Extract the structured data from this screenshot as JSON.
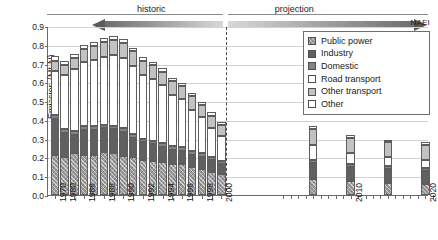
{
  "chart_data": {
    "type": "bar",
    "stacked": true,
    "title": "",
    "xlabel": "",
    "ylabel": "Emission (Mt-N)",
    "ylim": [
      0.0,
      0.9
    ],
    "ytick_labels": [
      "0.0",
      "0.1",
      "0.2",
      "0.3",
      "0.4",
      "0.5",
      "0.6",
      "0.7",
      "0.8",
      "0.9"
    ],
    "ytick_values": [
      0.0,
      0.1,
      0.2,
      0.3,
      0.4,
      0.5,
      0.6,
      0.7,
      0.8,
      0.9
    ],
    "grid": true,
    "legend_position": "top-right",
    "source_label": "NAEI",
    "annotations": [
      {
        "text": "historic",
        "arrow": "left"
      },
      {
        "text": "projection",
        "arrow": "right"
      }
    ],
    "divider_after": 2000,
    "x": [
      1970,
      1980,
      1985,
      1986,
      1987,
      1988,
      1989,
      1990,
      1991,
      1992,
      1993,
      1994,
      1995,
      1996,
      1997,
      1998,
      1999,
      2000,
      2005,
      2010,
      2015,
      2020
    ],
    "xtick_labels": [
      "1970",
      "1980",
      "1986",
      "1988",
      "1990",
      "1992",
      "1994",
      "1996",
      "1998",
      "2000",
      "2010",
      "2020"
    ],
    "series": [
      {
        "name": "Public power",
        "color": "#9a9a9a",
        "values": [
          0.215,
          0.205,
          0.225,
          0.215,
          0.215,
          0.23,
          0.225,
          0.21,
          0.2,
          0.185,
          0.18,
          0.175,
          0.165,
          0.165,
          0.15,
          0.14,
          0.125,
          0.11,
          0.085,
          0.075,
          0.065,
          0.06
        ]
      },
      {
        "name": "Industry",
        "color": "#606060",
        "values": [
          0.19,
          0.125,
          0.095,
          0.13,
          0.13,
          0.125,
          0.125,
          0.125,
          0.105,
          0.095,
          0.09,
          0.08,
          0.075,
          0.07,
          0.065,
          0.065,
          0.06,
          0.055,
          0.085,
          0.075,
          0.075,
          0.07
        ]
      },
      {
        "name": "Domestic",
        "color": "#848484",
        "values": [
          0.02,
          0.02,
          0.02,
          0.02,
          0.02,
          0.02,
          0.02,
          0.02,
          0.02,
          0.02,
          0.02,
          0.02,
          0.02,
          0.02,
          0.02,
          0.02,
          0.018,
          0.018,
          0.015,
          0.015,
          0.015,
          0.015
        ]
      },
      {
        "name": "Road transport",
        "color": "#ffffff",
        "values": [
          0.235,
          0.29,
          0.33,
          0.345,
          0.355,
          0.36,
          0.375,
          0.375,
          0.36,
          0.34,
          0.33,
          0.31,
          0.275,
          0.255,
          0.22,
          0.19,
          0.155,
          0.13,
          0.08,
          0.06,
          0.045,
          0.04
        ]
      },
      {
        "name": "Other transport",
        "color": "#c2c2c2",
        "values": [
          0.055,
          0.055,
          0.06,
          0.07,
          0.075,
          0.08,
          0.08,
          0.08,
          0.08,
          0.075,
          0.07,
          0.07,
          0.07,
          0.07,
          0.07,
          0.065,
          0.065,
          0.06,
          0.085,
          0.08,
          0.08,
          0.08
        ]
      },
      {
        "name": "Other",
        "color": "#ffffff",
        "values": [
          0.025,
          0.02,
          0.02,
          0.02,
          0.02,
          0.02,
          0.02,
          0.02,
          0.02,
          0.02,
          0.02,
          0.02,
          0.02,
          0.018,
          0.018,
          0.018,
          0.017,
          0.017,
          0.015,
          0.015,
          0.015,
          0.015
        ]
      }
    ]
  },
  "legend": {
    "items": [
      {
        "label": "Public power",
        "swatch": "#9a9a9a",
        "key": "public"
      },
      {
        "label": "Industry",
        "swatch": "#606060",
        "key": "industry"
      },
      {
        "label": "Domestic",
        "swatch": "#848484",
        "key": "domestic"
      },
      {
        "label": "Road transport",
        "swatch": "#ffffff",
        "key": "road"
      },
      {
        "label": "Other transport",
        "swatch": "#c2c2c2",
        "key": "othertr"
      },
      {
        "label": "Other",
        "swatch": "#ffffff",
        "key": "other"
      }
    ]
  }
}
